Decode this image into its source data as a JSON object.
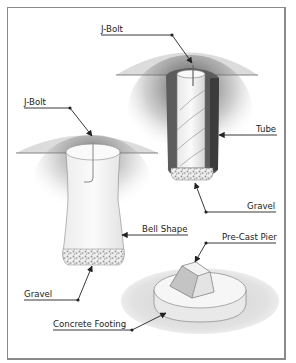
{
  "figure": {
    "labels": {
      "jbolt_tube": "J-Bolt",
      "tube": "Tube",
      "gravel_tube": "Gravel",
      "jbolt_bell": "J-Bolt",
      "bell_shape": "Bell Shape",
      "gravel_bell": "Gravel",
      "precast_pier": "Pre-Cast Pier",
      "concrete_footing": "Concrete Footing"
    },
    "components": [
      {
        "name": "Tube pier",
        "parts": [
          "J-Bolt",
          "Tube",
          "Gravel"
        ]
      },
      {
        "name": "Bell-shaped pier",
        "parts": [
          "J-Bolt",
          "Bell Shape",
          "Gravel"
        ]
      },
      {
        "name": "Pre-cast pier",
        "parts": [
          "Pre-Cast Pier",
          "Concrete Footing"
        ]
      }
    ],
    "colors": {
      "ground": "#dcdcdc",
      "hole_dark": "#5a5a5a",
      "concrete": "#f4f4f4",
      "outline": "#555555",
      "text": "#222222",
      "frame": "#8a8a8a"
    }
  }
}
